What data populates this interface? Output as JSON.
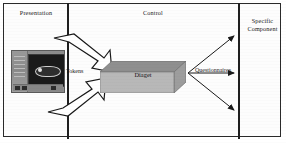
{
  "diagram": {
    "columns": [
      {
        "id": "presentation",
        "label": "Presentation"
      },
      {
        "id": "control",
        "label": "Control"
      },
      {
        "id": "specific-component",
        "label": "Specific\nComponent"
      }
    ],
    "labels": {
      "presentation": "Presentation",
      "control": "Control",
      "specific_component": "Specific Component",
      "specific_component_line1": "Specific",
      "specific_component_line2": "Component",
      "tokens": "Tokens",
      "diaget": "Diaget",
      "questionnaires": "Questionnaires"
    },
    "nodes": [
      {
        "name": "screenshot-thumbnail",
        "column": "presentation",
        "kind": "image"
      },
      {
        "name": "diaget-slab",
        "column": "control",
        "kind": "3d-box",
        "label": "Diaget"
      }
    ],
    "connectors": [
      {
        "name": "tokens-arrow-upper",
        "style": "block-arrow",
        "from": "presentation",
        "to": "diaget-slab",
        "label": "Tokens"
      },
      {
        "name": "tokens-arrow-lower",
        "style": "block-arrow",
        "from": "presentation",
        "to": "diaget-slab",
        "label": "Tokens"
      },
      {
        "name": "questionnaires-arrow-top",
        "style": "thin-arrow",
        "from": "diaget-slab",
        "to": "specific-component",
        "label": "Questionnaires"
      },
      {
        "name": "questionnaires-arrow-middle",
        "style": "thin-arrow",
        "from": "diaget-slab",
        "to": "specific-component",
        "label": "Questionnaires"
      },
      {
        "name": "questionnaires-arrow-bottom",
        "style": "thin-arrow",
        "from": "diaget-slab",
        "to": "specific-component",
        "label": "Questionnaires"
      }
    ],
    "colors": {
      "frame_border": "#2a2a2a",
      "divider": "#1f1f1f",
      "slab_top": "#8f8f8f",
      "slab_front": "#b8b8b8",
      "slab_side": "#9d9d9d",
      "arrow_fill": "#ffffff",
      "arrow_stroke": "#1a1a1a",
      "text": "#141414",
      "background": "#ffffff"
    }
  }
}
